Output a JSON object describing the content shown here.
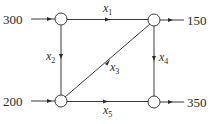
{
  "diagram": {
    "type": "network-flow",
    "nodes": [
      {
        "id": "A",
        "position": "top-left",
        "cx": 61,
        "cy": 19
      },
      {
        "id": "B",
        "position": "top-right",
        "cx": 154,
        "cy": 20
      },
      {
        "id": "C",
        "position": "bottom-left",
        "cx": 61,
        "cy": 101
      },
      {
        "id": "D",
        "position": "bottom-right",
        "cx": 154,
        "cy": 102
      }
    ],
    "external_flows": {
      "in_top_left": "300",
      "out_top_right": "150",
      "in_bottom_left": "200",
      "out_bottom_right": "350"
    },
    "edges": {
      "x1": {
        "var": "x",
        "sub": "1",
        "from": "A",
        "to": "B"
      },
      "x2": {
        "var": "x",
        "sub": "2",
        "from": "A",
        "to": "C"
      },
      "x3": {
        "var": "x",
        "sub": "3",
        "from": "C",
        "to": "B"
      },
      "x4": {
        "var": "x",
        "sub": "4",
        "from": "B",
        "to": "D"
      },
      "x5": {
        "var": "x",
        "sub": "5",
        "from": "C",
        "to": "D"
      }
    }
  }
}
